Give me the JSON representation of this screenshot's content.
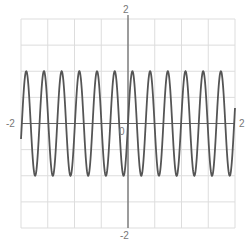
{
  "chart_data": {
    "type": "line",
    "title": "",
    "xlabel": "",
    "ylabel": "",
    "xlim": [
      -2,
      2
    ],
    "ylim": [
      -2,
      2
    ],
    "grid": true,
    "grid_step": 0.5,
    "function": "sin(19x)",
    "omega": 19,
    "amplitude": 1,
    "samples": 800,
    "tick_labels": {
      "x_min": "-2",
      "x_max": "2",
      "y_max": "2",
      "y_min": "-2",
      "origin": "0"
    },
    "series": [
      {
        "name": "y = sin(19x)",
        "color": "#555555"
      }
    ]
  },
  "colors": {
    "grid": "#dddddd",
    "axis": "#666666",
    "curve": "#555555"
  }
}
